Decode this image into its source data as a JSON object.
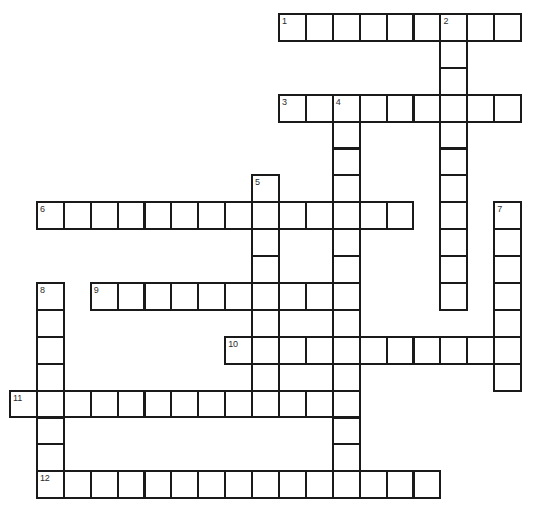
{
  "puzzle": {
    "type": "crossword-grid",
    "title": "Crossword Puzzle Grid",
    "grid": {
      "cell_size": 26.9,
      "origin_x": 9,
      "origin_y": 13,
      "cols": 19,
      "rows": 18,
      "border_color": "#1a1a1a",
      "cell_fill": "#ffffff",
      "background": "#ffffff",
      "number_color": "#2b2b2b"
    },
    "entries": [
      {
        "number": "1",
        "direction": "across",
        "row": 0,
        "col": 10,
        "length": 9
      },
      {
        "number": "2",
        "direction": "down",
        "row": 0,
        "col": 16,
        "length": 11
      },
      {
        "number": "3",
        "direction": "across",
        "row": 3,
        "col": 10,
        "length": 9
      },
      {
        "number": "4",
        "direction": "down",
        "row": 3,
        "col": 12,
        "length": 15
      },
      {
        "number": "5",
        "direction": "down",
        "row": 6,
        "col": 9,
        "length": 9
      },
      {
        "number": "6",
        "direction": "across",
        "row": 7,
        "col": 1,
        "length": 14
      },
      {
        "number": "7",
        "direction": "down",
        "row": 7,
        "col": 18,
        "length": 7
      },
      {
        "number": "8",
        "direction": "down",
        "row": 10,
        "col": 1,
        "length": 7
      },
      {
        "number": "9",
        "direction": "across",
        "row": 10,
        "col": 3,
        "length": 10
      },
      {
        "number": "10",
        "direction": "across",
        "row": 12,
        "col": 8,
        "length": 11
      },
      {
        "number": "11",
        "direction": "across",
        "row": 14,
        "col": 0,
        "length": 12
      },
      {
        "number": "12",
        "direction": "across",
        "row": 17,
        "col": 1,
        "length": 15
      }
    ],
    "numbers": [
      {
        "label": "1",
        "row": 0,
        "col": 10
      },
      {
        "label": "2",
        "row": 0,
        "col": 16
      },
      {
        "label": "3",
        "row": 3,
        "col": 10
      },
      {
        "label": "4",
        "row": 3,
        "col": 12
      },
      {
        "label": "5",
        "row": 6,
        "col": 9
      },
      {
        "label": "6",
        "row": 7,
        "col": 1
      },
      {
        "label": "7",
        "row": 7,
        "col": 18
      },
      {
        "label": "8",
        "row": 10,
        "col": 1
      },
      {
        "label": "9",
        "row": 10,
        "col": 3
      },
      {
        "label": "10",
        "row": 12,
        "col": 8
      },
      {
        "label": "11",
        "row": 14,
        "col": 0
      },
      {
        "label": "12",
        "row": 17,
        "col": 1
      }
    ]
  }
}
